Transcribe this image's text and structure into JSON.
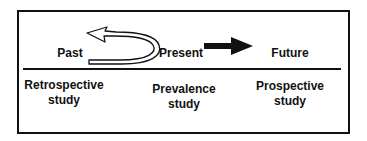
{
  "timeline": {
    "past": "Past",
    "present": "Present",
    "future": "Future"
  },
  "studies": {
    "retrospective": [
      "Retrospective",
      "study"
    ],
    "prevalence": [
      "Prevalence",
      "study"
    ],
    "prospective": [
      "Prospective",
      "study"
    ]
  },
  "colors": {
    "stroke": "#111111",
    "background": "#ffffff"
  }
}
